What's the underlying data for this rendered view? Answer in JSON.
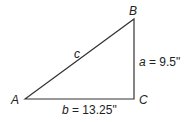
{
  "diagram": {
    "type": "right-triangle",
    "vertices": [
      {
        "name": "A",
        "x": 25,
        "y": 99
      },
      {
        "name": "B",
        "x": 134,
        "y": 19
      },
      {
        "name": "C",
        "x": 134,
        "y": 99
      }
    ],
    "labels": {
      "A": "A",
      "B": "B",
      "C": "C",
      "c": "c",
      "a_var": "a",
      "a_val": " = 9.5\"",
      "b_var": "b",
      "b_val": " = 13.25\""
    },
    "line_color": "#333333"
  }
}
